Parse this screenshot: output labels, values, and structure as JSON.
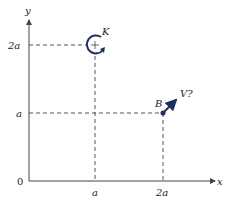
{
  "diagram": {
    "axes": {
      "x_label": "x",
      "y_label": "y",
      "origin_label": "0"
    },
    "x_ticks": [
      {
        "label": "a"
      },
      {
        "label": "2a"
      }
    ],
    "y_ticks": [
      {
        "label": "a"
      },
      {
        "label": "2a"
      }
    ],
    "couple": {
      "label": "K",
      "position": "(a, 2a)",
      "direction": "clockwise",
      "center_mark": "+"
    },
    "point_B": {
      "label": "B",
      "position": "(2a, a)",
      "velocity_label": "V?"
    },
    "colors": {
      "axis": "#444444",
      "dashed": "#555555",
      "accent": "#1f2f5c"
    }
  }
}
